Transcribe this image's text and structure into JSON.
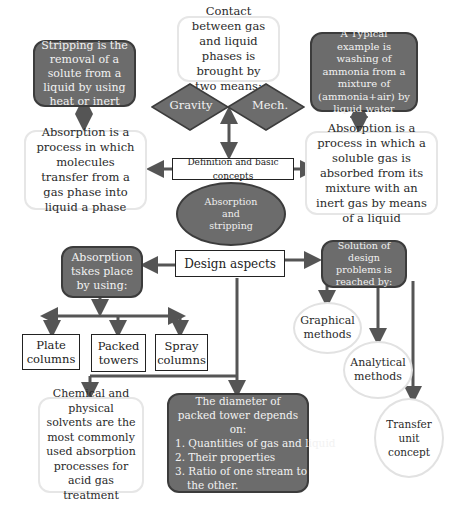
{
  "diagram": {
    "center": {
      "ellipse_lines": [
        "Absorption",
        "and",
        "stripping"
      ],
      "definition_label": "Definition and basic concepts",
      "design_label": "Design aspects"
    },
    "stripping_box": "Stripping is the removal of a solute from a liquid by using heat or inert",
    "absorption_def_left": "Absorption is a process in which molecules transfer from a gas phase into liquid a phase",
    "contact_box": "Contact between gas and liquid phases is brought by two means:",
    "diamonds": {
      "left": "Gravity",
      "right": "Mech."
    },
    "example_box": "A Typical example is washing of ammonia from a mixture of (ammonia+air) by liquid water",
    "absorption_def_right": "Absorption is a process in which a soluble gas is absorbed from its mixture with an inert gas by means of a liquid",
    "takes_place_box": "Absorption tskes place by using:",
    "equipment": [
      "Plate columns",
      "Packed towers",
      "Spray columns"
    ],
    "solution_box": "Solution of design problems is reached by:",
    "methods": [
      "Graphical methods",
      "Analytical methods",
      "Transfer unit concept"
    ],
    "solvents_box": "Chemical and physical solvents are the most commonly used absorption processes for acid gas treatment",
    "diameter_box": {
      "title": "The diameter of packed tower depends on:",
      "items": [
        "1. Quantities of gas and liquid",
        "2. Their properties",
        "3. Ratio of one stream to",
        "the other."
      ]
    },
    "colors": {
      "dark_fill": "#6c6c6c",
      "dark_border": "#3c3c3c",
      "light_border": "#e6e6e6",
      "arrow": "#555555"
    }
  }
}
